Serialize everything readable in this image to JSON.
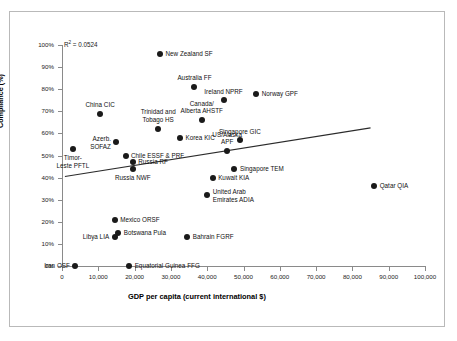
{
  "figure": {
    "r_squared_prefix": "R",
    "r_squared_sup": "2",
    "r_squared_text": " = 0.0524"
  },
  "chart_data": {
    "type": "scatter",
    "title": "",
    "subtitle": "",
    "xlabel": "GDP per capita (current international $)",
    "ylabel": "Compliance (%)",
    "xlim": [
      0,
      100000
    ],
    "ylim": [
      0,
      100
    ],
    "xticks": [
      0,
      10000,
      20000,
      30000,
      40000,
      50000,
      60000,
      70000,
      80000,
      90000,
      100000
    ],
    "xtick_labels": [
      "0",
      "10,000",
      "20,000",
      "30,000",
      "40,000",
      "50,000",
      "60,000",
      "70,000",
      "80,000",
      "90,000",
      "100,000"
    ],
    "yticks": [
      0,
      10,
      20,
      30,
      40,
      50,
      60,
      70,
      80,
      90,
      100
    ],
    "ytick_labels": [
      "0%",
      "10%",
      "20%",
      "30%",
      "40%",
      "50%",
      "60%",
      "70%",
      "80%",
      "90%",
      "100%"
    ],
    "grid": false,
    "legend": "none",
    "annotations": [
      {
        "name": "r-squared",
        "text": "R2 = 0.0524",
        "value": 0.0524
      }
    ],
    "trendline": {
      "type": "linear",
      "x_start": 800,
      "y_start": 40.5,
      "x_end": 85000,
      "y_end": 62.5
    },
    "marker_color": "#1a1a1a",
    "points": [
      {
        "label": "New Zealand SF",
        "x": 27000,
        "y": 96,
        "label_pos": "right"
      },
      {
        "label": "Australia FF",
        "x": 36500,
        "y": 81,
        "label_pos": "above"
      },
      {
        "label": "Ireland NPRF",
        "x": 44500,
        "y": 75,
        "label_pos": "above"
      },
      {
        "label": "Norway GPF",
        "x": 53500,
        "y": 78,
        "label_pos": "right"
      },
      {
        "label": "Canada/\nAlberta AHSTF",
        "x": 38500,
        "y": 66,
        "label_pos": "above"
      },
      {
        "label": "China CIC",
        "x": 10500,
        "y": 69,
        "label_pos": "above"
      },
      {
        "label": "Trinidad and\nTobago HS",
        "x": 26500,
        "y": 62,
        "label_pos": "above"
      },
      {
        "label": "Korea KIC",
        "x": 32500,
        "y": 58,
        "label_pos": "right"
      },
      {
        "label": "Singapore GIC",
        "x": 49000,
        "y": 57,
        "label_pos": "above"
      },
      {
        "label": "US/Alaska\nAPF",
        "x": 45500,
        "y": 52,
        "label_pos": "above"
      },
      {
        "label": "Azerb.\nSOFAZ",
        "x": 15000,
        "y": 56,
        "label_pos": "left"
      },
      {
        "label": "Chile ESSF & PRF",
        "x": 17500,
        "y": 50,
        "label_pos": "right"
      },
      {
        "label": "Timor-\nLeste PFTL",
        "x": 3000,
        "y": 53,
        "label_pos": "below"
      },
      {
        "label": "Russia RF",
        "x": 19500,
        "y": 47,
        "label_pos": "right"
      },
      {
        "label": "Singapore TEM",
        "x": 47500,
        "y": 44,
        "label_pos": "right"
      },
      {
        "label": "Russia NWF",
        "x": 19500,
        "y": 44,
        "label_pos": "below"
      },
      {
        "label": "Kuwait KIA",
        "x": 41500,
        "y": 40,
        "label_pos": "right"
      },
      {
        "label": "United Arab\nEmirates ADIA",
        "x": 40000,
        "y": 32,
        "label_pos": "right"
      },
      {
        "label": "Qatar QIA",
        "x": 86000,
        "y": 36,
        "label_pos": "right"
      },
      {
        "label": "Mexico ORSF",
        "x": 14500,
        "y": 21,
        "label_pos": "right"
      },
      {
        "label": "Botswana Pula",
        "x": 15500,
        "y": 15,
        "label_pos": "right"
      },
      {
        "label": "Libya LIA",
        "x": 14500,
        "y": 13,
        "label_pos": "left"
      },
      {
        "label": "Bahrain FGRF",
        "x": 34500,
        "y": 13,
        "label_pos": "right"
      },
      {
        "label": "Iran OSF",
        "x": 3700,
        "y": 0,
        "label_pos": "left"
      },
      {
        "label": "Equatorial Guinea FFG",
        "x": 18500,
        "y": 0,
        "label_pos": "right"
      }
    ]
  }
}
